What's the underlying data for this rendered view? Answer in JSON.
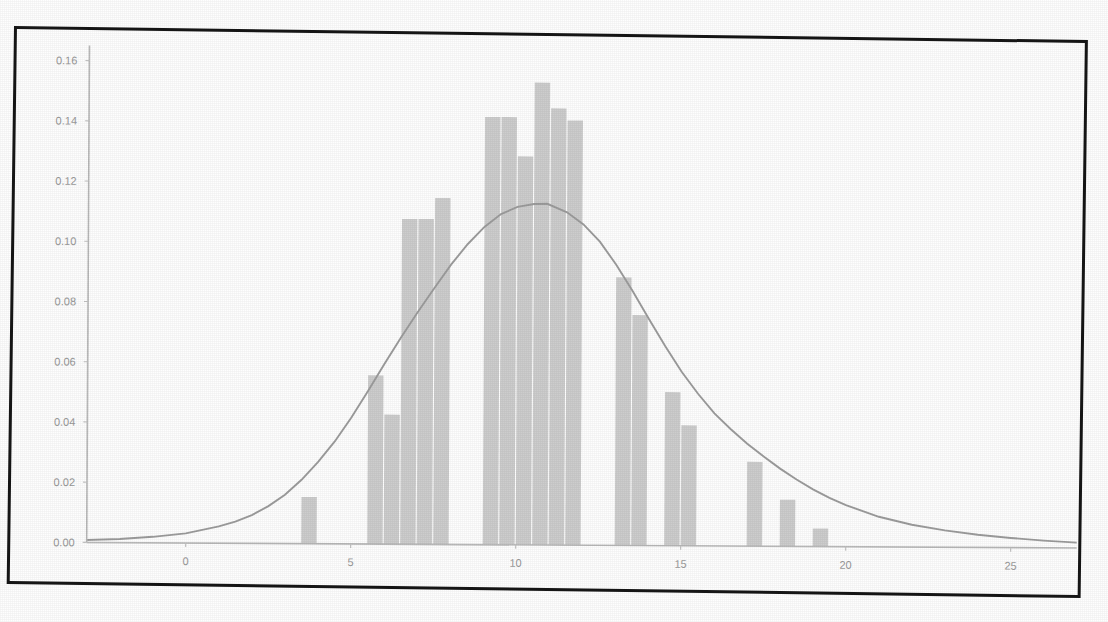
{
  "figure": {
    "kind": "scanned-figure",
    "border_color": "#161616",
    "background": "#ffffff"
  },
  "chart_data": {
    "type": "bar",
    "title": "",
    "subtitle": "",
    "xlabel": "",
    "ylabel": "",
    "grid": false,
    "legend": null,
    "xlim": [
      -3.0,
      27.0
    ],
    "ylim": [
      0.0,
      0.165
    ],
    "xticks": [
      0,
      5,
      10,
      15,
      20,
      25
    ],
    "xtick_labels": [
      "0",
      "5",
      "10",
      "15",
      "20",
      "25"
    ],
    "yticks": [
      0.0,
      0.02,
      0.04,
      0.06,
      0.08,
      0.1,
      0.12,
      0.14,
      0.16
    ],
    "ytick_labels": [
      "0.00",
      "0.02",
      "0.04",
      "0.06",
      "0.08",
      "0.10",
      "0.12",
      "0.14",
      "0.16"
    ],
    "bar_color": "#cdcdcd",
    "line_color": "#9c9c9c",
    "bin_width": 0.5,
    "bars": [
      {
        "x": 3.5,
        "value": 0.0155
      },
      {
        "x": 5.5,
        "value": 0.056
      },
      {
        "x": 6.0,
        "value": 0.043
      },
      {
        "x": 6.5,
        "value": 0.108
      },
      {
        "x": 7.0,
        "value": 0.108
      },
      {
        "x": 7.5,
        "value": 0.115
      },
      {
        "x": 9.0,
        "value": 0.142
      },
      {
        "x": 9.5,
        "value": 0.142
      },
      {
        "x": 10.0,
        "value": 0.129
      },
      {
        "x": 10.5,
        "value": 0.1535
      },
      {
        "x": 11.0,
        "value": 0.145
      },
      {
        "x": 11.5,
        "value": 0.141
      },
      {
        "x": 13.0,
        "value": 0.089
      },
      {
        "x": 13.5,
        "value": 0.0765
      },
      {
        "x": 14.5,
        "value": 0.051
      },
      {
        "x": 15.0,
        "value": 0.04
      },
      {
        "x": 17.0,
        "value": 0.028
      },
      {
        "x": 18.0,
        "value": 0.0155
      },
      {
        "x": 19.0,
        "value": 0.006
      }
    ],
    "series": [
      {
        "name": "kde",
        "type": "line",
        "x": [
          -3.0,
          -2.0,
          -1.0,
          0.0,
          1.0,
          1.5,
          2.0,
          2.5,
          3.0,
          3.5,
          4.0,
          4.5,
          5.0,
          5.5,
          6.0,
          6.5,
          7.0,
          7.5,
          8.0,
          8.5,
          9.0,
          9.5,
          10.0,
          10.5,
          10.9,
          11.5,
          12.0,
          12.5,
          13.0,
          13.5,
          14.0,
          14.5,
          15.0,
          15.5,
          16.0,
          16.5,
          17.0,
          17.5,
          18.0,
          18.5,
          19.0,
          19.5,
          20.0,
          21.0,
          22.0,
          23.0,
          24.0,
          25.0,
          26.0,
          27.0
        ],
        "y": [
          0.0008,
          0.0012,
          0.002,
          0.0032,
          0.0056,
          0.0072,
          0.0094,
          0.0124,
          0.0162,
          0.0212,
          0.0272,
          0.034,
          0.042,
          0.0508,
          0.06,
          0.0688,
          0.0772,
          0.0852,
          0.093,
          0.0998,
          0.1055,
          0.1098,
          0.1122,
          0.1132,
          0.1133,
          0.1105,
          0.1065,
          0.1008,
          0.0932,
          0.0845,
          0.0752,
          0.0662,
          0.0578,
          0.0505,
          0.044,
          0.0388,
          0.034,
          0.0298,
          0.0258,
          0.0222,
          0.019,
          0.0162,
          0.0138,
          0.01,
          0.0074,
          0.0056,
          0.0042,
          0.0032,
          0.0024,
          0.0018
        ]
      }
    ]
  }
}
